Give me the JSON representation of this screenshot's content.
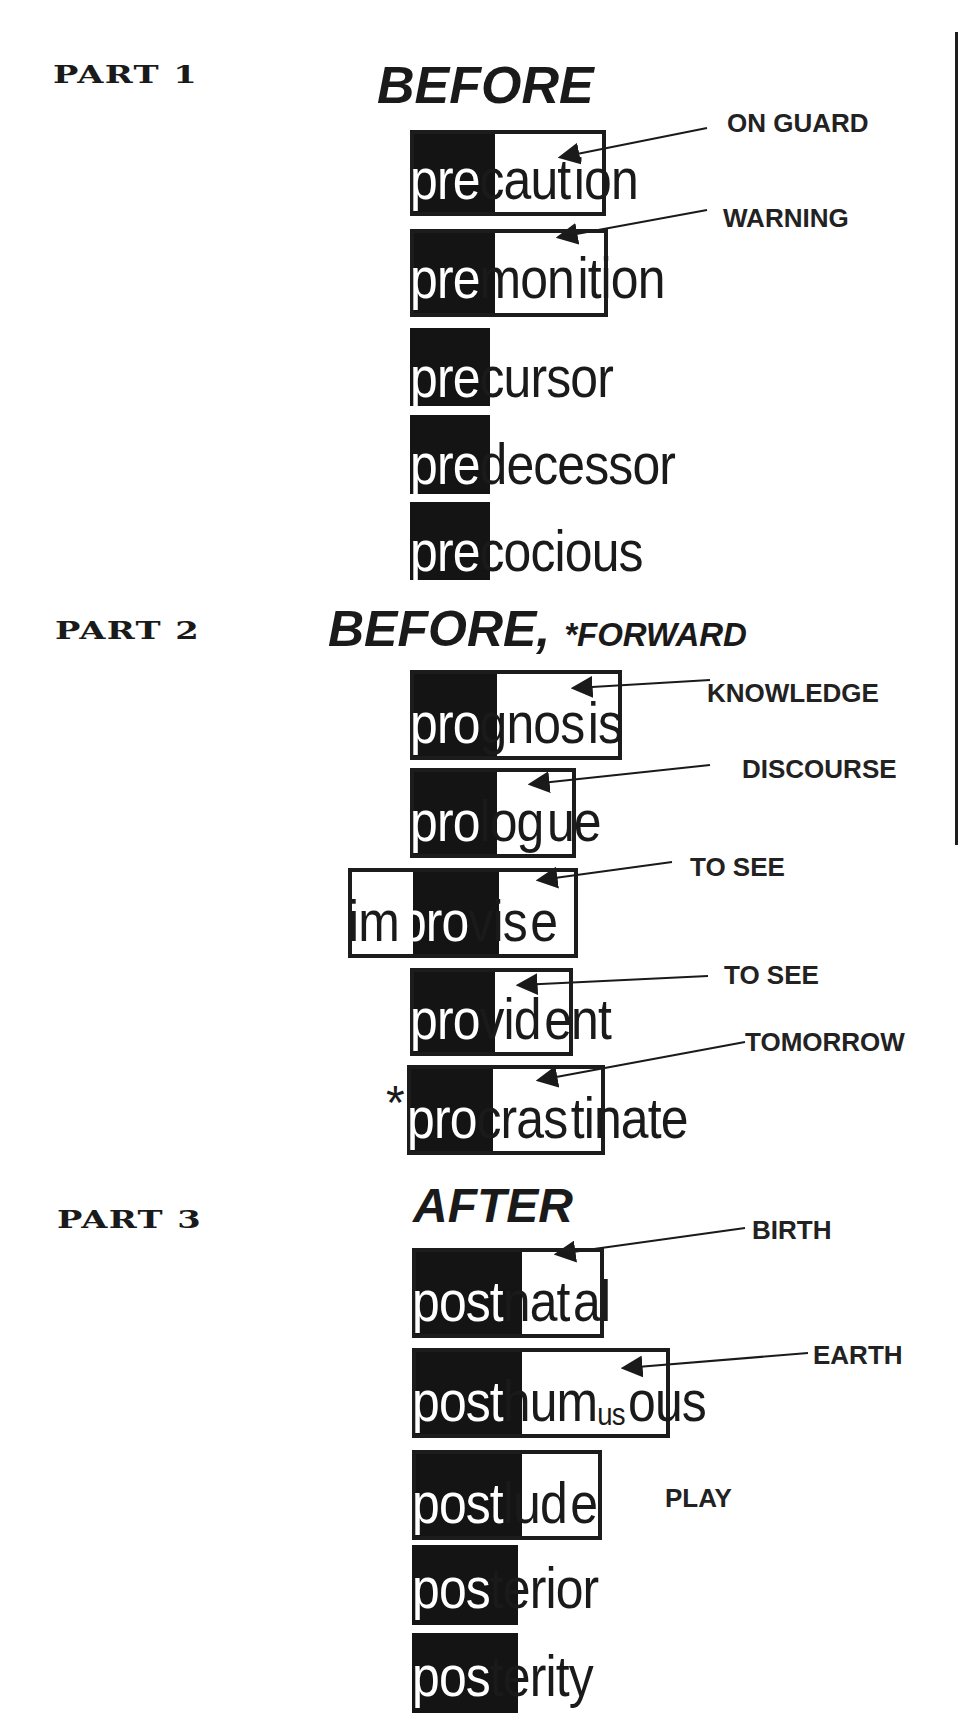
{
  "parts": [
    {
      "label": "PART 1",
      "heading": "BEFORE",
      "words": [
        {
          "prefix": "pre",
          "root": "caut",
          "suffix": "ion",
          "gloss": "ON GUARD"
        },
        {
          "prefix": "pre",
          "root": "mon",
          "suffix": "ition",
          "gloss": "WARNING"
        },
        {
          "prefix": "pre",
          "root": "",
          "suffix": "cursor",
          "gloss": ""
        },
        {
          "prefix": "pre",
          "root": "",
          "suffix": "decessor",
          "gloss": ""
        },
        {
          "prefix": "pre",
          "root": "",
          "suffix": "cocious",
          "gloss": ""
        }
      ]
    },
    {
      "label": "PART 2",
      "heading": "BEFORE,",
      "heading_note": "*FORWARD",
      "words": [
        {
          "prefix": "pro",
          "root": "gnos",
          "suffix": "is",
          "gloss": "KNOWLEDGE"
        },
        {
          "prefix": "pro",
          "root": "log",
          "suffix": "ue",
          "gloss": "DISCOURSE"
        },
        {
          "pre_prefix": "im",
          "prefix": "pro",
          "root": "vis",
          "suffix": "e",
          "gloss": "TO SEE"
        },
        {
          "prefix": "pro",
          "root": "vid",
          "suffix": "ent",
          "gloss": "TO SEE"
        },
        {
          "marker": "*",
          "prefix": "pro",
          "root": "cras",
          "suffix": "tinate",
          "gloss": "TOMORROW"
        }
      ]
    },
    {
      "label": "PART 3",
      "heading": "AFTER",
      "words": [
        {
          "prefix": "post",
          "root": "nat",
          "suffix": "al",
          "gloss": "BIRTH"
        },
        {
          "prefix": "post",
          "root": "hum",
          "root_small": "us",
          "suffix": "ous",
          "gloss": "EARTH"
        },
        {
          "prefix": "post",
          "root": "lud",
          "suffix": "e",
          "gloss": "PLAY"
        },
        {
          "prefix": "pos",
          "root": "",
          "suffix": "terior",
          "overlap": "t",
          "gloss": ""
        },
        {
          "prefix": "pos",
          "root": "",
          "suffix": "terity",
          "overlap": "t",
          "gloss": ""
        }
      ]
    }
  ],
  "colors": {
    "ink": "#1a1a1a",
    "fill": "#141414",
    "paper": "#ffffff"
  }
}
